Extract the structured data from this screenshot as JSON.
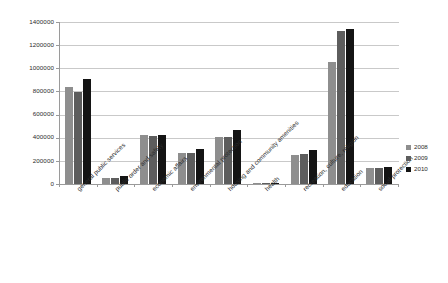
{
  "chart_data": {
    "type": "bar",
    "title": "",
    "subtitle": "",
    "xlabel": "",
    "ylabel": "",
    "ylim": [
      0,
      1400000
    ],
    "ytick_step": 200000,
    "yticks": [
      "0",
      "200000",
      "400000",
      "600000",
      "800000",
      "1000000",
      "1200000",
      "1400000"
    ],
    "grid": true,
    "legend_position": "right",
    "categories": [
      "general public services",
      "public order and safety",
      "economic affairs",
      "environmental protection",
      "housing and community amenities",
      "health",
      "recreation, culture, religion",
      "education",
      "social protection"
    ],
    "series": [
      {
        "name": "2008",
        "color": "#8e8e8e",
        "values": [
          835000,
          52000,
          420000,
          270000,
          405000,
          6000,
          250000,
          1055000,
          140000
        ]
      },
      {
        "name": "2009",
        "color": "#5d5d5d",
        "values": [
          795000,
          52000,
          415000,
          272000,
          410000,
          6000,
          262000,
          1320000,
          142000
        ]
      },
      {
        "name": "2010",
        "color": "#141414",
        "values": [
          905000,
          70000,
          425000,
          300000,
          465000,
          6000,
          290000,
          1340000,
          150000
        ]
      }
    ]
  }
}
